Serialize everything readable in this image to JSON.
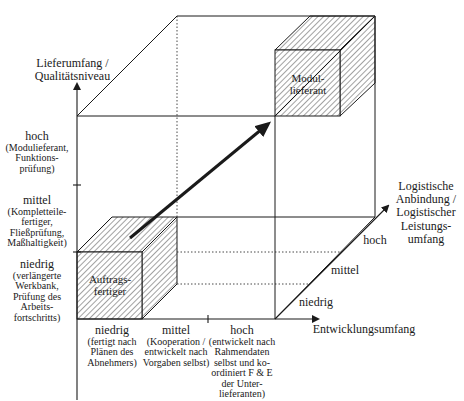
{
  "y_axis": {
    "title": "Lieferumfang / Qualitätsniveau",
    "levels": [
      {
        "label": "hoch",
        "detail": "(Modulieferant, Funktions-prüfung)"
      },
      {
        "label": "mittel",
        "detail": "(Kompletteile-fertiger, Fließprüfung, Maßhaltigkeit)"
      },
      {
        "label": "niedrig",
        "detail": "(verlängerte Werkbank, Prüfung des Arbeits-fortschritts)"
      }
    ]
  },
  "x_axis": {
    "title": "Entwicklungsumfang",
    "levels": [
      {
        "label": "niedrig",
        "detail": "(fertigt nach Plänen des Abnehmers)"
      },
      {
        "label": "mittel",
        "detail": "(Kooperation / entwickelt nach Vorgaben selbst)"
      },
      {
        "label": "hoch",
        "detail": "(entwickelt nach Rahmendaten selbst und ko-ordiniert F & E der Unter-lieferanten)"
      }
    ]
  },
  "z_axis": {
    "title": "Logistische Anbindung / Logistischer Leistungs-umfang",
    "levels": [
      "niedrig",
      "mittel",
      "hoch"
    ]
  },
  "cubes": {
    "start": "Auftrags-fertiger",
    "end": "Modul-lieferant"
  },
  "colors": {
    "line": "#1a1a1a",
    "hatch": "#555555",
    "background": "#ffffff"
  }
}
